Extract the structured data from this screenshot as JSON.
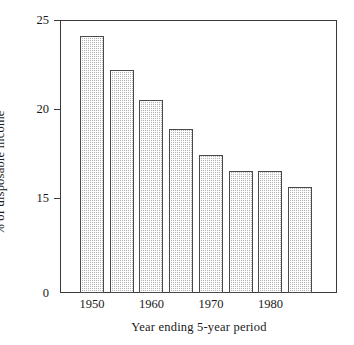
{
  "chart_data": {
    "type": "bar",
    "title": "",
    "subtitle": "",
    "xlabel": "Year ending 5-year period",
    "ylabel": "% of disposable income",
    "categories": [
      "1950",
      "1955",
      "1960",
      "1965",
      "1970",
      "1975",
      "1980",
      "1985"
    ],
    "values": [
      24.1,
      22.2,
      20.5,
      18.9,
      17.4,
      16.5,
      16.5,
      15.6
    ],
    "xtick_labels": [
      "1950",
      "1960",
      "1970",
      "1980"
    ],
    "xtick_categories": [
      "1950",
      "1960",
      "1970",
      "1980"
    ],
    "ytick_labels": [
      "0",
      "15",
      "20",
      "25"
    ],
    "ylim": [
      0,
      25
    ],
    "yticks": [
      0,
      15,
      20,
      25
    ],
    "axis_break": true,
    "axis_break_note": "y-axis compressed between 0 and 15",
    "grid": false,
    "legend": "none",
    "bar_fill": "#b4b4b4",
    "bar_edge": "#4a4a4a",
    "axis_color": "#3a3a3a",
    "background": "#ffffff"
  },
  "axis": {
    "y_title": "% of disposable income",
    "x_title": "Year ending 5-year period"
  }
}
